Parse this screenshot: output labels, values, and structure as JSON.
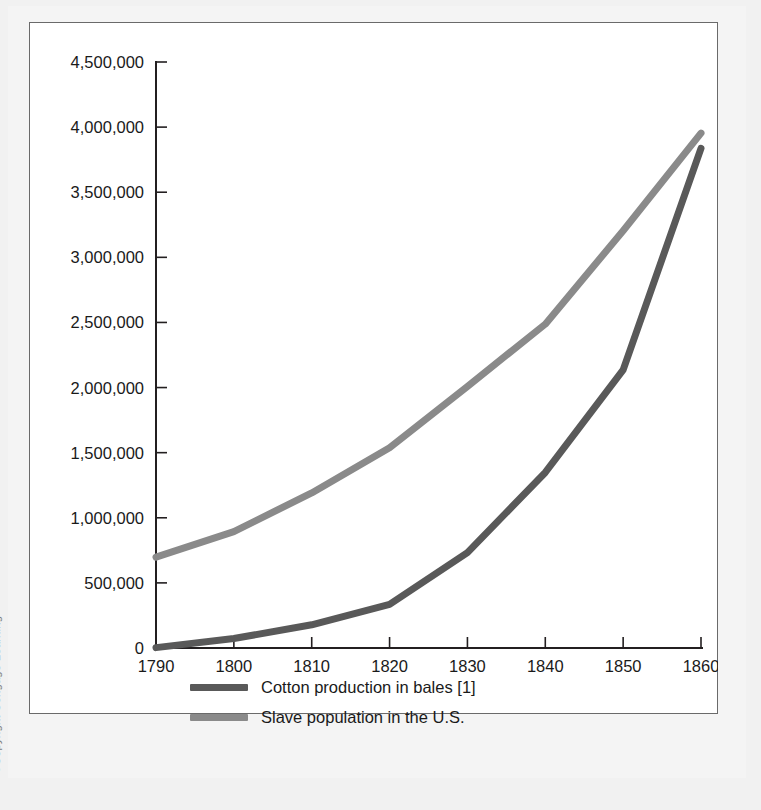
{
  "attribution": {
    "text": "©Copyright Cengage Learning"
  },
  "legend": {
    "items": [
      {
        "label": "Cotton production in bales [1]",
        "color": "#595959",
        "swatch_name": "legend-swatch-cotton"
      },
      {
        "label": "Slave population in the U.S.",
        "color": "#8a8a8a",
        "swatch_name": "legend-swatch-slaves"
      }
    ]
  },
  "chart_data": {
    "type": "line",
    "title": "",
    "subtitle": "",
    "xlabel": "",
    "ylabel": "",
    "x": [
      1790,
      1800,
      1810,
      1820,
      1830,
      1840,
      1850,
      1860
    ],
    "categories": [
      "1790",
      "1800",
      "1810",
      "1820",
      "1830",
      "1840",
      "1850",
      "1860"
    ],
    "xlim": [
      1790,
      1860
    ],
    "ylim": [
      0,
      4500000
    ],
    "ytick_values": [
      0,
      500000,
      1000000,
      1500000,
      2000000,
      2500000,
      3000000,
      3500000,
      4000000,
      4500000
    ],
    "ytick_labels": [
      "0",
      "500,000",
      "1,000,000",
      "1,500,000",
      "2,000,000",
      "2,500,000",
      "3,000,000",
      "3,500,000",
      "4,000,000",
      "4,500,000"
    ],
    "xtick_labels": [
      "1790",
      "1800",
      "1810",
      "1820",
      "1830",
      "1840",
      "1850",
      "1860"
    ],
    "grid": false,
    "legend_position": "below",
    "series": [
      {
        "name": "Cotton production in bales [1]",
        "color": "#595959",
        "values": [
          3000,
          73000,
          178000,
          335000,
          732000,
          1348000,
          2136000,
          3837000
        ]
      },
      {
        "name": "Slave population in the U.S.",
        "color": "#8a8a8a",
        "values": [
          698000,
          894000,
          1191000,
          1538000,
          2009000,
          2487000,
          3204000,
          3954000
        ]
      }
    ]
  }
}
